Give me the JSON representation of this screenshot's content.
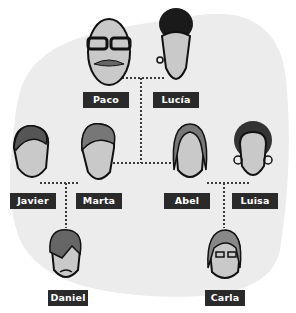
{
  "colors": {
    "background": "#ffffff",
    "blob": "#ececec",
    "label_bg": "#2a2a2a",
    "label_text": "#ffffff",
    "connector": "#3a3a3a",
    "skin": "#c9c9c9"
  },
  "family": {
    "generation1": [
      {
        "name": "Paco",
        "icon": "grandfather-glasses-mustache-icon"
      },
      {
        "name": "Lucía",
        "icon": "grandmother-bun-icon"
      }
    ],
    "generation2": [
      {
        "name": "Javier",
        "icon": "man-wavy-hair-icon"
      },
      {
        "name": "Marta",
        "icon": "woman-short-hair-icon"
      },
      {
        "name": "Abel",
        "icon": "man-long-hair-icon"
      },
      {
        "name": "Luisa",
        "icon": "woman-curly-hair-icon"
      }
    ],
    "generation3": [
      {
        "name": "Daniel",
        "icon": "boy-fringe-icon"
      },
      {
        "name": "Carla",
        "icon": "girl-glasses-icon"
      }
    ]
  },
  "relations": [
    {
      "type": "couple",
      "members": [
        "Paco",
        "Lucía"
      ]
    },
    {
      "type": "couple",
      "members": [
        "Javier",
        "Marta"
      ]
    },
    {
      "type": "couple",
      "members": [
        "Abel",
        "Luisa"
      ]
    },
    {
      "type": "children",
      "parents": [
        "Paco",
        "Lucía"
      ],
      "children": [
        "Marta",
        "Abel"
      ]
    },
    {
      "type": "children",
      "parents": [
        "Javier",
        "Marta"
      ],
      "children": [
        "Daniel"
      ]
    },
    {
      "type": "children",
      "parents": [
        "Abel",
        "Luisa"
      ],
      "children": [
        "Carla"
      ]
    }
  ]
}
